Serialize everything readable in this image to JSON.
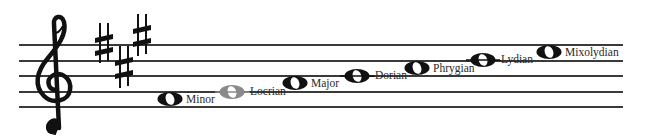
{
  "diagram": {
    "clef": "treble-clef",
    "key_signature": {
      "sharps": [
        {
          "note": "F#",
          "x": 103,
          "y": 43
        },
        {
          "note": "C#",
          "x": 123,
          "y": 65
        },
        {
          "note": "G#",
          "x": 141,
          "y": 35
        }
      ]
    },
    "staff": {
      "lines_y": [
        45,
        61,
        76,
        92,
        107
      ],
      "x_start": 19,
      "x_end": 623,
      "line_color": "#3a3a3a"
    },
    "notes": [
      {
        "label": "Minor",
        "x": 170,
        "y": 99,
        "on_line": false,
        "color": "#111111",
        "connector": false
      },
      {
        "label": "Locrian",
        "x": 232,
        "y": 92,
        "on_line": true,
        "color": "#8a8a8a",
        "connector": true
      },
      {
        "label": "Major",
        "x": 295,
        "y": 83,
        "on_line": false,
        "color": "#111111",
        "connector": false
      },
      {
        "label": "Dorian",
        "x": 357,
        "y": 76,
        "on_line": true,
        "color": "#111111",
        "connector": true
      },
      {
        "label": "Phrygian",
        "x": 417,
        "y": 68,
        "on_line": false,
        "color": "#111111",
        "connector": false
      },
      {
        "label": "Lydian",
        "x": 483,
        "y": 60,
        "on_line": true,
        "color": "#111111",
        "connector": true
      },
      {
        "label": "Mixolydian",
        "x": 549,
        "y": 52,
        "on_line": false,
        "color": "#111111",
        "connector": false
      }
    ]
  }
}
